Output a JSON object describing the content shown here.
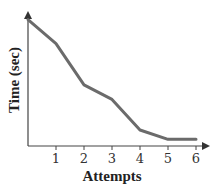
{
  "chart_data": {
    "type": "line",
    "title": "",
    "xlabel": "Attempts",
    "ylabel": "Time (sec)",
    "x": [
      0,
      1,
      2,
      3,
      4,
      5,
      6
    ],
    "x_tick_labels": [
      "1",
      "2",
      "3",
      "4",
      "5",
      "6"
    ],
    "y_tick_labels": [],
    "series": [
      {
        "name": "Time",
        "values": [
          9.5,
          7.7,
          4.6,
          3.5,
          1.2,
          0.5,
          0.5
        ]
      }
    ],
    "xlim": [
      0,
      6.3
    ],
    "ylim": [
      0,
      10
    ],
    "grid": false,
    "legend": null,
    "line_color": "#6b6b6b",
    "axis_color": "#444444"
  }
}
